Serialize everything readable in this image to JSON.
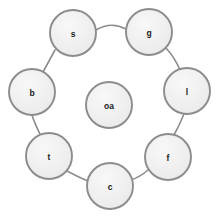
{
  "diagram": {
    "type": "node-link-graph",
    "layout": "circular-ring-with-center",
    "canvas": {
      "width": 221,
      "height": 219,
      "background": "#ffffff"
    },
    "style": {
      "node_fill": "#efefef",
      "node_fill_highlight": "#f7f7f7",
      "node_stroke": "#8c8c8c",
      "node_radius": 23,
      "edge_stroke": "#8c8c8c",
      "label_color": "#1a1a1a"
    },
    "nodes": [
      {
        "id": "s",
        "label": "s",
        "cx": 73,
        "cy": 33,
        "r": 23
      },
      {
        "id": "g",
        "label": "g",
        "cx": 149,
        "cy": 32,
        "r": 23
      },
      {
        "id": "l",
        "label": "l",
        "cx": 187,
        "cy": 91,
        "r": 23
      },
      {
        "id": "f",
        "label": "f",
        "cx": 168,
        "cy": 157,
        "r": 23
      },
      {
        "id": "c",
        "label": "c",
        "cx": 110,
        "cy": 186,
        "r": 23
      },
      {
        "id": "t",
        "label": "t",
        "cx": 49,
        "cy": 156,
        "r": 23
      },
      {
        "id": "b",
        "label": "b",
        "cx": 32,
        "cy": 92,
        "r": 23
      },
      {
        "id": "oa",
        "label": "oa",
        "cx": 109,
        "cy": 105,
        "r": 23
      }
    ],
    "edges": [
      {
        "from": "s",
        "to": "g",
        "path": "M 96 30 Q 111 21 126 29"
      },
      {
        "from": "g",
        "to": "l",
        "path": "M 166 48 Q 175 58 180 70"
      },
      {
        "from": "l",
        "to": "f",
        "path": "M 184 114 Q 179 126 174 135"
      },
      {
        "from": "f",
        "to": "c",
        "path": "M 148 170 Q 140 177 131 180"
      },
      {
        "from": "c",
        "to": "t",
        "path": "M 88 181 Q 78 177 67 171"
      },
      {
        "from": "t",
        "to": "b",
        "path": "M 40 134 Q 34 122 32 115"
      },
      {
        "from": "b",
        "to": "s",
        "path": "M 43 72 Q 49 61 55 50"
      }
    ]
  }
}
